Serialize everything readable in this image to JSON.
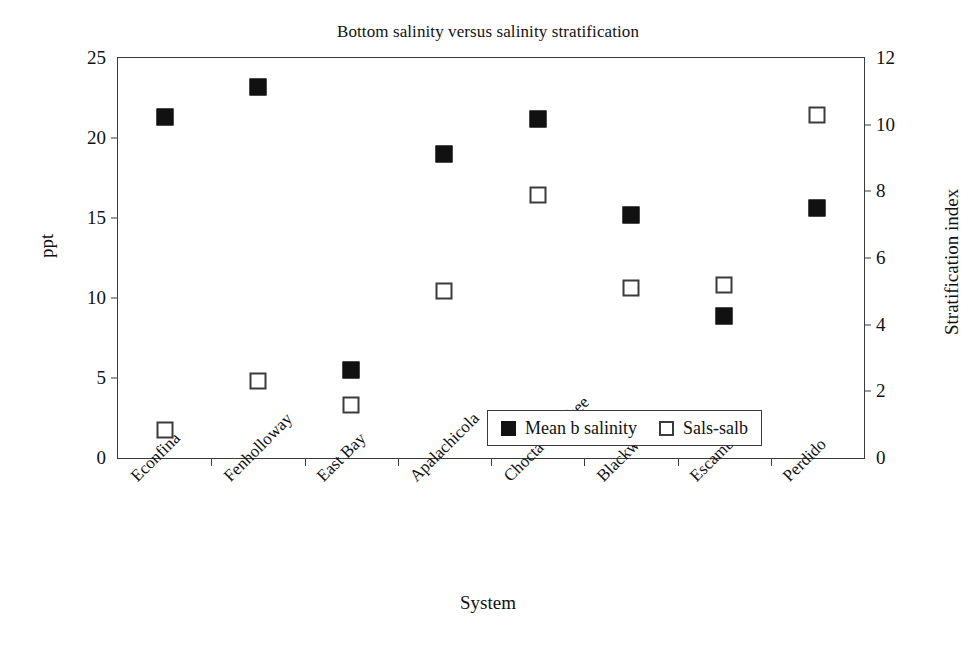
{
  "chart_data": {
    "type": "scatter",
    "title": "Bottom salinity versus salinity stratification",
    "xlabel": "System",
    "ylabel": "ppt",
    "y2label": "Stratification index",
    "categories": [
      "Econfina",
      "Fenholloway",
      "East Bay",
      "Apalachicola",
      "Choctawhatchee",
      "Blackwater",
      "Escambia",
      "Perdido"
    ],
    "ylim": [
      0,
      25
    ],
    "yticks": [
      0,
      5,
      10,
      15,
      20,
      25
    ],
    "y2lim": [
      0,
      12
    ],
    "y2ticks": [
      0,
      2,
      4,
      6,
      8,
      10,
      12
    ],
    "grid": false,
    "legend_position": "inside-bottom-right",
    "series": [
      {
        "name": "Mean b salinity",
        "marker": "filled-square",
        "color": "#111111",
        "axis": "left",
        "values": [
          21.3,
          23.2,
          5.5,
          19.0,
          21.2,
          15.2,
          8.9,
          15.6
        ]
      },
      {
        "name": "Sals-salb",
        "marker": "open-square",
        "color": "#ffffff",
        "axis": "right",
        "values": [
          0.85,
          2.3,
          1.6,
          5.0,
          7.9,
          5.1,
          5.2,
          10.3
        ]
      }
    ]
  },
  "legend": {
    "entries": [
      {
        "label": "Mean b salinity",
        "marker": "filled-square"
      },
      {
        "label": "Sals-salb",
        "marker": "open-square"
      }
    ]
  }
}
